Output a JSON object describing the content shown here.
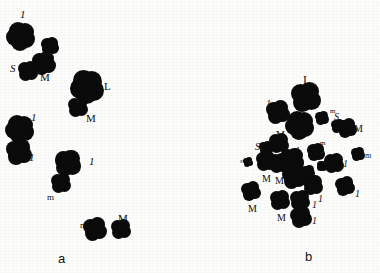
{
  "figure": {
    "background_color": "#fdfdfb",
    "ink_color": "#0b0b0b",
    "width": 380,
    "height": 273,
    "panel_a_letter": "a",
    "panel_b_letter": "b"
  },
  "legend": {
    "size_codes": [
      "L",
      "M",
      "S",
      "l",
      "m",
      "s"
    ]
  },
  "panel_a": {
    "letter": "a",
    "letter_x": 58,
    "letter_y": 252,
    "objects": [
      {
        "id": "a1",
        "label": "1",
        "label_style": "italic",
        "label_size": 11,
        "label_x": 20,
        "label_y": 9,
        "cx": 21,
        "cy": 36,
        "r": 11.5,
        "lobes": 5
      },
      {
        "id": "a2",
        "label": "",
        "label_style": "none",
        "label_size": 0,
        "label_x": 0,
        "label_y": 0,
        "cx": 50,
        "cy": 46,
        "r": 7.5,
        "lobes": 4
      },
      {
        "id": "a3",
        "label": "S",
        "label_style": "italic",
        "label_size": 11,
        "label_x": 10,
        "label_y": 63,
        "cx": 28,
        "cy": 71,
        "r": 8.5,
        "lobes": 4
      },
      {
        "id": "a4",
        "label": "M",
        "label_style": "normal",
        "label_size": 11,
        "label_x": 40,
        "label_y": 72,
        "cx": 44,
        "cy": 63,
        "r": 9.5,
        "lobes": 4
      },
      {
        "id": "a5",
        "label": "L",
        "label_style": "normal",
        "label_size": 11,
        "label_x": 104,
        "label_y": 81,
        "cx": 87,
        "cy": 87,
        "r": 13.5,
        "lobes": 5
      },
      {
        "id": "a6",
        "label": "M",
        "label_style": "normal",
        "label_size": 11,
        "label_x": 86,
        "label_y": 113,
        "cx": 78,
        "cy": 107,
        "r": 8.5,
        "lobes": 4
      },
      {
        "id": "a7",
        "label": "1",
        "label_style": "italic",
        "label_size": 11,
        "label_x": 31,
        "label_y": 112,
        "cx": 20,
        "cy": 129,
        "r": 11.5,
        "lobes": 5
      },
      {
        "id": "a8",
        "label": "1",
        "label_style": "italic",
        "label_size": 11,
        "label_x": 29,
        "label_y": 152,
        "cx": 19,
        "cy": 152,
        "r": 10.5,
        "lobes": 4
      },
      {
        "id": "a9",
        "label": "1",
        "label_style": "italic",
        "label_size": 11,
        "label_x": 89,
        "label_y": 156,
        "cx": 68,
        "cy": 163,
        "r": 11.0,
        "lobes": 4
      },
      {
        "id": "a10",
        "label": "m",
        "label_style": "normal",
        "label_size": 9,
        "label_x": 47,
        "label_y": 193,
        "cx": 61,
        "cy": 183,
        "r": 8.5,
        "lobes": 4
      },
      {
        "id": "a11",
        "label": "m",
        "label_style": "normal",
        "label_size": 9,
        "label_x": 80,
        "label_y": 221,
        "cx": 95,
        "cy": 229,
        "r": 9.5,
        "lobes": 4
      },
      {
        "id": "a12",
        "label": "M",
        "label_style": "normal",
        "label_size": 11,
        "label_x": 118,
        "label_y": 213,
        "cx": 121,
        "cy": 229,
        "r": 8.5,
        "lobes": 4
      }
    ]
  },
  "panel_b": {
    "letter": "b",
    "letter_x": 305,
    "letter_y": 250,
    "objects": [
      {
        "id": "b1",
        "label": "L",
        "label_style": "normal",
        "label_size": 12,
        "label_x": 303,
        "label_y": 74,
        "cx": 306,
        "cy": 97,
        "r": 12.5,
        "lobes": 4
      },
      {
        "id": "b2",
        "label": "1",
        "label_style": "italic",
        "label_size": 10,
        "label_x": 266,
        "label_y": 99,
        "cx": 278,
        "cy": 112,
        "r": 9.5,
        "lobes": 4
      },
      {
        "id": "b3",
        "label": "L",
        "label_style": "normal",
        "label_size": 9,
        "label_x": 299,
        "label_y": 110,
        "cx": 300,
        "cy": 125,
        "r": 11.5,
        "lobes": 5
      },
      {
        "id": "b4",
        "label": "m",
        "label_style": "normal",
        "label_size": 7,
        "label_x": 330,
        "label_y": 108,
        "cx": 322,
        "cy": 118,
        "r": 6.0,
        "lobes": 4
      },
      {
        "id": "b5",
        "label": "S",
        "label_style": "italic",
        "label_size": 10,
        "label_x": 334,
        "label_y": 112,
        "cx": 338,
        "cy": 126,
        "r": 6.0,
        "lobes": 4
      },
      {
        "id": "b6",
        "label": "M",
        "label_style": "normal",
        "label_size": 10,
        "label_x": 354,
        "label_y": 124,
        "cx": 347,
        "cy": 128,
        "r": 8.0,
        "lobes": 4
      },
      {
        "id": "b7",
        "label": "M",
        "label_style": "normal",
        "label_size": 10,
        "label_x": 276,
        "label_y": 130,
        "cx": 279,
        "cy": 143,
        "r": 8.5,
        "lobes": 4
      },
      {
        "id": "b8",
        "label": "S",
        "label_style": "italic",
        "label_size": 10,
        "label_x": 255,
        "label_y": 142,
        "cx": 266,
        "cy": 148,
        "r": 5.5,
        "lobes": 4
      },
      {
        "id": "b9",
        "label": "m",
        "label_style": "normal",
        "label_size": 7,
        "label_x": 320,
        "label_y": 140,
        "cx": 316,
        "cy": 152,
        "r": 7.5,
        "lobes": 4
      },
      {
        "id": "b10",
        "label": "1",
        "label_style": "italic",
        "label_size": 10,
        "label_x": 295,
        "label_y": 146,
        "cx": 292,
        "cy": 160,
        "r": 10.0,
        "lobes": 4
      },
      {
        "id": "b11",
        "label": "s",
        "label_style": "italic",
        "label_size": 7,
        "label_x": 240,
        "label_y": 158,
        "cx": 248,
        "cy": 162,
        "r": 4.0,
        "lobes": 4
      },
      {
        "id": "b12",
        "label": "M",
        "label_style": "normal",
        "label_size": 10,
        "label_x": 262,
        "label_y": 174,
        "cx": 266,
        "cy": 161,
        "r": 8.5,
        "lobes": 4
      },
      {
        "id": "b13",
        "label": "M",
        "label_style": "normal",
        "label_size": 10,
        "label_x": 275,
        "label_y": 176,
        "cx": 279,
        "cy": 163,
        "r": 8.5,
        "lobes": 4
      },
      {
        "id": "b14",
        "label": "s",
        "label_style": "italic",
        "label_size": 7,
        "label_x": 326,
        "label_y": 156,
        "cx": 322,
        "cy": 166,
        "r": 4.5,
        "lobes": 4
      },
      {
        "id": "b15",
        "label": "1",
        "label_style": "italic",
        "label_size": 10,
        "label_x": 343,
        "label_y": 159,
        "cx": 334,
        "cy": 163,
        "r": 8.5,
        "lobes": 4
      },
      {
        "id": "b16",
        "label": "m",
        "label_style": "normal",
        "label_size": 8,
        "label_x": 365,
        "label_y": 152,
        "cx": 358,
        "cy": 154,
        "r": 6.0,
        "lobes": 4
      },
      {
        "id": "b17",
        "label": "m",
        "label_style": "normal",
        "label_size": 7,
        "label_x": 300,
        "label_y": 168,
        "cx": 308,
        "cy": 172,
        "r": 5.5,
        "lobes": 4
      },
      {
        "id": "b18",
        "label": "1",
        "label_style": "italic",
        "label_size": 10,
        "label_x": 304,
        "label_y": 185,
        "cx": 294,
        "cy": 177,
        "r": 9.5,
        "lobes": 4
      },
      {
        "id": "b19",
        "label": "1",
        "label_style": "italic",
        "label_size": 10,
        "label_x": 318,
        "label_y": 194,
        "cx": 313,
        "cy": 185,
        "r": 8.5,
        "lobes": 4
      },
      {
        "id": "b20",
        "label": "1",
        "label_style": "italic",
        "label_size": 10,
        "label_x": 355,
        "label_y": 189,
        "cx": 345,
        "cy": 186,
        "r": 8.0,
        "lobes": 4
      },
      {
        "id": "b21",
        "label": "1",
        "label_style": "italic",
        "label_size": 10,
        "label_x": 312,
        "label_y": 200,
        "cx": 300,
        "cy": 200,
        "r": 8.5,
        "lobes": 4
      },
      {
        "id": "b22",
        "label": "M",
        "label_style": "normal",
        "label_size": 10,
        "label_x": 248,
        "label_y": 204,
        "cx": 251,
        "cy": 191,
        "r": 8.0,
        "lobes": 4
      },
      {
        "id": "b23",
        "label": "M",
        "label_style": "normal",
        "label_size": 10,
        "label_x": 277,
        "label_y": 213,
        "cx": 280,
        "cy": 200,
        "r": 8.5,
        "lobes": 4
      },
      {
        "id": "b24",
        "label": "1",
        "label_style": "italic",
        "label_size": 10,
        "label_x": 312,
        "label_y": 216,
        "cx": 301,
        "cy": 217,
        "r": 9.0,
        "lobes": 4
      }
    ]
  }
}
